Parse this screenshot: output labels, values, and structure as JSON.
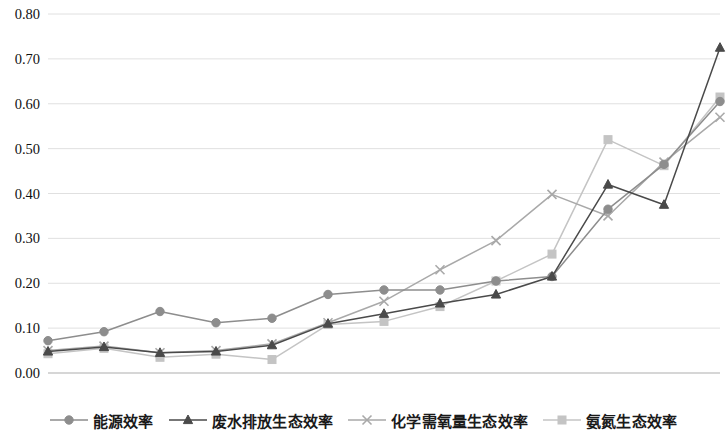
{
  "chart_data": {
    "type": "line",
    "title": "",
    "subtitle": "",
    "xlabel": "",
    "ylabel": "",
    "grid": true,
    "legend_position": "bottom",
    "categories": [
      "2001",
      "2002",
      "2003",
      "2004",
      "2005",
      "2006",
      "2007",
      "2008",
      "2009",
      "2010",
      "2011",
      "2012",
      "2013"
    ],
    "x": [
      2001,
      2002,
      2003,
      2004,
      2005,
      2006,
      2007,
      2008,
      2009,
      2010,
      2011,
      2012,
      2013
    ],
    "ylim": [
      0.0,
      0.8
    ],
    "ytick_labels": [
      "0.00",
      "0.10",
      "0.20",
      "0.30",
      "0.40",
      "0.50",
      "0.60",
      "0.70",
      "0.80"
    ],
    "ytick_values": [
      0.0,
      0.1,
      0.2,
      0.3,
      0.4,
      0.5,
      0.6,
      0.7,
      0.8
    ],
    "xtick_labels": [
      "2001",
      "2002",
      "2003",
      "2004",
      "2005",
      "2006",
      "2007",
      "2008",
      "2009",
      "2010",
      "2011",
      "2012",
      "2013"
    ],
    "series": [
      {
        "name": "能源效率",
        "marker": "circle",
        "color": "#8d8d8d",
        "values": [
          0.072,
          0.092,
          0.137,
          0.112,
          0.122,
          0.175,
          0.185,
          0.185,
          0.205,
          0.215,
          0.365,
          0.465,
          0.605
        ]
      },
      {
        "name": "废水排放生态效率",
        "marker": "triangle",
        "color": "#4a4a4a",
        "values": [
          0.048,
          0.058,
          0.045,
          0.048,
          0.062,
          0.11,
          0.132,
          0.155,
          0.175,
          0.215,
          0.42,
          0.375,
          0.725
        ]
      },
      {
        "name": "化学需氧量生态效率",
        "marker": "cross",
        "color": "#a9a9a9",
        "values": [
          0.05,
          0.06,
          0.045,
          0.05,
          0.065,
          0.112,
          0.16,
          0.23,
          0.295,
          0.398,
          0.35,
          0.47,
          0.57
        ]
      },
      {
        "name": "氨氮生态效率",
        "marker": "square",
        "color": "#c4c4c4",
        "values": [
          0.043,
          0.055,
          0.035,
          0.042,
          0.03,
          0.108,
          0.115,
          0.148,
          0.205,
          0.265,
          0.52,
          0.462,
          0.615
        ]
      }
    ]
  },
  "legend": {
    "items": [
      {
        "label": "能源效率",
        "marker": "circle",
        "color": "#8d8d8d"
      },
      {
        "label": "废水排放生态效率",
        "marker": "triangle",
        "color": "#4a4a4a"
      },
      {
        "label": "化学需氧量生态效率",
        "marker": "cross",
        "color": "#a9a9a9"
      },
      {
        "label": "氨氮生态效率",
        "marker": "square",
        "color": "#c4c4c4"
      }
    ]
  },
  "colors": {
    "grid": "#d8d8d8",
    "axis": "#bdbdbd",
    "text": "#111111",
    "background": "#ffffff"
  }
}
